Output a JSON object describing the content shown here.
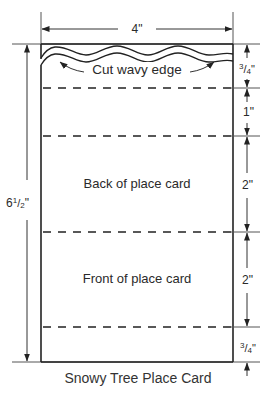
{
  "diagram": {
    "title": "Snowy Tree Place Card",
    "card": {
      "width_label": "4\"",
      "height_label": "6¹/₂\"",
      "height_whole": "6",
      "height_num": "1",
      "height_den": "2",
      "cut_label": "Cut wavy edge",
      "sections": [
        {
          "label": "",
          "dimension": "3/4\"",
          "num": "3",
          "den": "4"
        },
        {
          "label": "",
          "dimension": "1\""
        },
        {
          "label": "Back of place card",
          "dimension": "2\""
        },
        {
          "label": "Front of place card",
          "dimension": "2\""
        },
        {
          "label": "",
          "dimension": "3/4\"",
          "num": "3",
          "den": "4"
        }
      ]
    },
    "colors": {
      "line": "#222222",
      "thin_line": "#555555",
      "background": "#ffffff"
    }
  }
}
